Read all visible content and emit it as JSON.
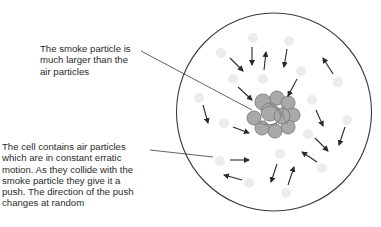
{
  "diagram": {
    "labels": {
      "smoke_particle": "The smoke particle is\nmuch larger than the\nair particles",
      "air_particles": "The cell contains air particles\nwhich are in constant erratic\nmotion. As they collide with the\nsmoke particle they give it a\npush. The direction of the push\nchanges at random"
    },
    "elements": {
      "cell": "cell boundary",
      "smoke_particle": "smoke particle",
      "air_particles": "air particles",
      "motion_arrows": "air particle motion arrows"
    },
    "colors": {
      "outline": "#3a3a3a",
      "smoke_fill": "#a9a9a9",
      "smoke_stroke": "#7a7a7a",
      "air_particle": "#ececec",
      "text": "#2a2a2a"
    }
  }
}
